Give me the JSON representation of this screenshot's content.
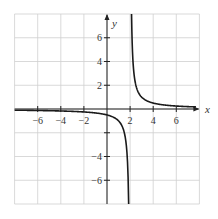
{
  "chart_data": {
    "type": "line",
    "title": "",
    "function": "y = 1/(x - 2)",
    "xlabel": "x",
    "ylabel": "y",
    "xlim": [
      -8,
      8
    ],
    "ylim": [
      -8,
      8
    ],
    "grid": true,
    "grid_spacing": 2,
    "x_tick_labels": [
      "-6",
      "-4",
      "-2",
      "2",
      "4",
      "6"
    ],
    "x_tick_values": [
      -6,
      -4,
      -2,
      2,
      4,
      6
    ],
    "y_tick_labels": [
      "6",
      "4",
      "2",
      "-4",
      "-6"
    ],
    "y_tick_values": [
      6,
      4,
      2,
      -4,
      -6
    ],
    "y_tick_marks": [
      -6,
      -4,
      -2,
      2,
      4,
      6
    ],
    "vertical_asymptote": 2,
    "horizontal_asymptote": 0,
    "series": [
      {
        "name": "left branch",
        "x": [
          -8,
          -6,
          -4,
          -2,
          0,
          1,
          1.5,
          1.75,
          1.875
        ],
        "y": [
          -0.1,
          -0.125,
          -0.167,
          -0.25,
          -0.5,
          -1,
          -2,
          -4,
          -8
        ]
      },
      {
        "name": "right branch",
        "x": [
          2.125,
          2.25,
          2.5,
          3,
          4,
          6,
          8
        ],
        "y": [
          8,
          4,
          2,
          1,
          0.5,
          0.25,
          0.167
        ]
      }
    ],
    "colors": {
      "curve": "#1a1a1a",
      "axes": "#222222",
      "grid": "#cfcfcf"
    }
  }
}
